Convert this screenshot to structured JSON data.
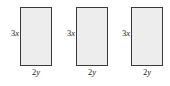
{
  "figure": {
    "type": "geometry-diagram",
    "background_color": "#ffffff",
    "rectangle_fill_color": "#ededed",
    "rectangle_border_color": "#3a3a3a",
    "label_color": "#1a1a1a",
    "rectangles": [
      {
        "height_label": "3x",
        "width_label": "2y",
        "height_coefficient": "3",
        "height_variable": "x",
        "width_coefficient": "2",
        "width_variable": "y"
      },
      {
        "height_label": "3x",
        "width_label": "2y",
        "height_coefficient": "3",
        "height_variable": "x",
        "width_coefficient": "2",
        "width_variable": "y"
      },
      {
        "height_label": "3x",
        "width_label": "2y",
        "height_coefficient": "3",
        "height_variable": "x",
        "width_coefficient": "2",
        "width_variable": "y"
      }
    ]
  }
}
